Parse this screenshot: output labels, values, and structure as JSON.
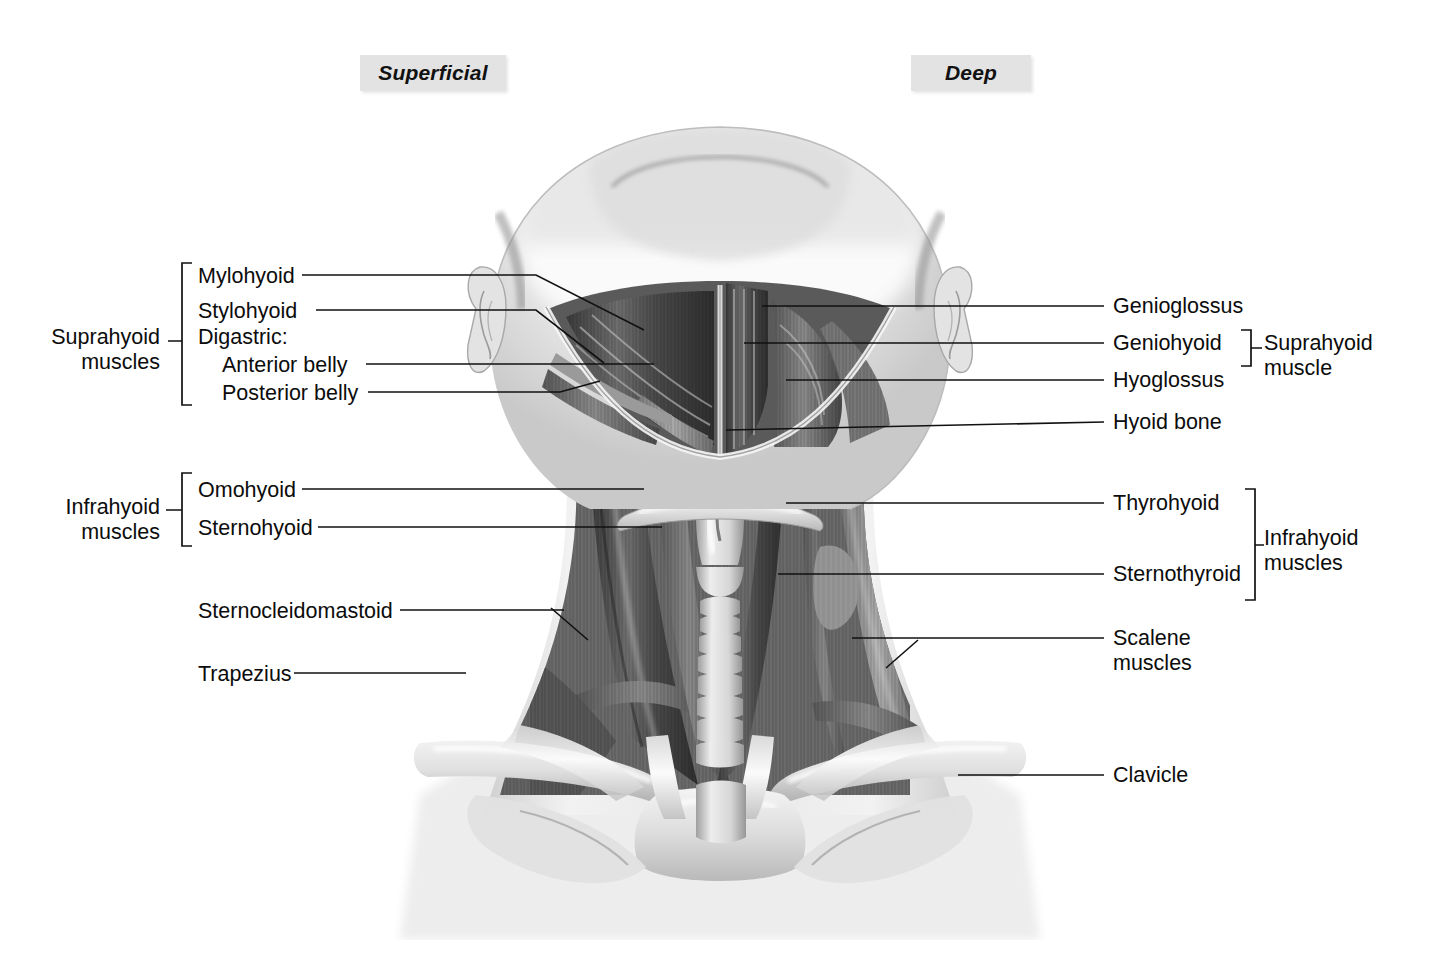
{
  "page": {
    "background": "#ffffff",
    "ink": "#111111",
    "header_box_fill": "#e3e3e3"
  },
  "headers": [
    {
      "id": "superficial",
      "label": "Superficial"
    },
    {
      "id": "deep",
      "label": "Deep"
    }
  ],
  "left_groups": [
    {
      "id": "suprahyoid-group",
      "label": "Suprahyoid\nmuscles"
    },
    {
      "id": "infrahyoid-group",
      "label": "Infrahyoid\nmuscles"
    }
  ],
  "right_groups": [
    {
      "id": "suprahyoid-group-right",
      "label": "Suprahyoid\nmuscle"
    },
    {
      "id": "infrahyoid-group-right",
      "label": "Infrahyoid\nmuscles"
    }
  ],
  "left_labels": [
    {
      "id": "mylohyoid",
      "label": "Mylohyoid"
    },
    {
      "id": "stylohyoid",
      "label": "Stylohyoid"
    },
    {
      "id": "digastric",
      "label": "Digastric:"
    },
    {
      "id": "anterior-belly",
      "label": "Anterior belly"
    },
    {
      "id": "posterior-belly",
      "label": "Posterior belly"
    },
    {
      "id": "omohyoid",
      "label": "Omohyoid"
    },
    {
      "id": "sternohyoid",
      "label": "Sternohyoid"
    },
    {
      "id": "sternocleidomastoid",
      "label": "Sternocleidomastoid"
    },
    {
      "id": "trapezius",
      "label": "Trapezius"
    }
  ],
  "right_labels": [
    {
      "id": "genioglossus",
      "label": "Genioglossus"
    },
    {
      "id": "geniohyoid",
      "label": "Geniohyoid"
    },
    {
      "id": "hyoglossus",
      "label": "Hyoglossus"
    },
    {
      "id": "hyoid-bone",
      "label": "Hyoid bone"
    },
    {
      "id": "thyrohyoid",
      "label": "Thyrohyoid"
    },
    {
      "id": "sternothyroid",
      "label": "Sternothyroid"
    },
    {
      "id": "scalene",
      "label": "Scalene\nmuscles"
    },
    {
      "id": "clavicle",
      "label": "Clavicle"
    }
  ],
  "illustration": {
    "id": "anterior-neck-anatomy",
    "style": "grayscale pencil rendering",
    "view": "anterior view of head and neck with superficial muscles on the left half and deep muscles on the right half"
  }
}
